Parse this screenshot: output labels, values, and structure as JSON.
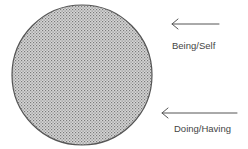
{
  "diagram": {
    "circle": {
      "cx": 82,
      "cy": 75,
      "r": 70,
      "stroke": "#555555",
      "fill_pattern": "dot-halftone",
      "fill_color": "#c8c8c8",
      "dot_color": "#888888"
    },
    "arrows": [
      {
        "direction": "left",
        "x1": 219,
        "x2": 172,
        "y": 24,
        "color": "#555555"
      },
      {
        "direction": "left",
        "x1": 237,
        "x2": 162,
        "y": 113,
        "color": "#555555"
      }
    ],
    "labels": {
      "top": "Being/Self",
      "bottom": "Doing/Having"
    }
  }
}
